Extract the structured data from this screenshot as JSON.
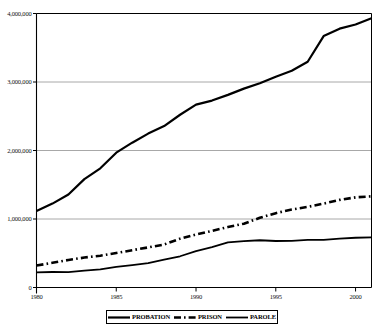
{
  "chart_data": {
    "type": "line",
    "title": "",
    "subtitle": "",
    "xlabel": "",
    "ylabel": "",
    "xlim": [
      1980,
      2001
    ],
    "ylim": [
      0,
      4000000
    ],
    "grid": true,
    "legend_position": "bottom",
    "x_ticks": [
      "1980",
      "1985",
      "1990",
      "1995",
      "2000"
    ],
    "x_tick_values": [
      1980,
      1985,
      1990,
      1995,
      2000
    ],
    "y_ticks": [
      "0",
      "1,000,000",
      "2,000,000",
      "3,000,000",
      "4,000,000"
    ],
    "y_tick_values": [
      0,
      1000000,
      2000000,
      3000000,
      4000000
    ],
    "x": [
      1980,
      1981,
      1982,
      1983,
      1984,
      1985,
      1986,
      1987,
      1988,
      1989,
      1990,
      1991,
      1992,
      1993,
      1994,
      1995,
      1996,
      1997,
      1998,
      1999,
      2000,
      2001
    ],
    "series": [
      {
        "name": "PROBATION",
        "style": "solid",
        "color": "#000000",
        "width": 2.2,
        "values": [
          1118000,
          1225000,
          1357000,
          1582000,
          1740000,
          1968000,
          2114000,
          2247000,
          2356000,
          2522000,
          2670000,
          2729000,
          2812000,
          2903000,
          2981000,
          3078000,
          3165000,
          3296000,
          3670000,
          3779000,
          3840000,
          3932000
        ]
      },
      {
        "name": "PRISON",
        "style": "dash-dot",
        "color": "#000000",
        "width": 2.6,
        "values": [
          320000,
          360000,
          402000,
          437000,
          464000,
          503000,
          545000,
          585000,
          628000,
          713000,
          774000,
          826000,
          883000,
          932000,
          1017000,
          1085000,
          1138000,
          1177000,
          1225000,
          1279000,
          1316000,
          1331000
        ]
      },
      {
        "name": "PAROLE",
        "style": "solid",
        "color": "#000000",
        "width": 1.8,
        "values": [
          220000,
          226000,
          225000,
          247000,
          266000,
          300000,
          327000,
          356000,
          408000,
          456000,
          531000,
          590000,
          658000,
          676000,
          690000,
          679000,
          680000,
          695000,
          696000,
          714000,
          726000,
          732000
        ]
      }
    ],
    "legend": [
      "PROBATION",
      "PRISON",
      "PAROLE"
    ]
  },
  "axis": {
    "y_tick_labels": [
      "4,000,000",
      "3,000,000",
      "2,000,000",
      "1,000,000",
      "0"
    ],
    "x_tick_labels": [
      "1980",
      "1985",
      "1990",
      "1995",
      "2000"
    ]
  },
  "legend": {
    "items": [
      {
        "label": "PROBATION",
        "swatch": "solid-thick-line-icon"
      },
      {
        "label": "PRISON",
        "swatch": "dash-dot-line-icon"
      },
      {
        "label": "PAROLE",
        "swatch": "solid-line-icon"
      }
    ]
  },
  "colors": {
    "axis": "#000000",
    "gridline": "#a8a8a8",
    "series": "#000000",
    "background": "#ffffff"
  }
}
